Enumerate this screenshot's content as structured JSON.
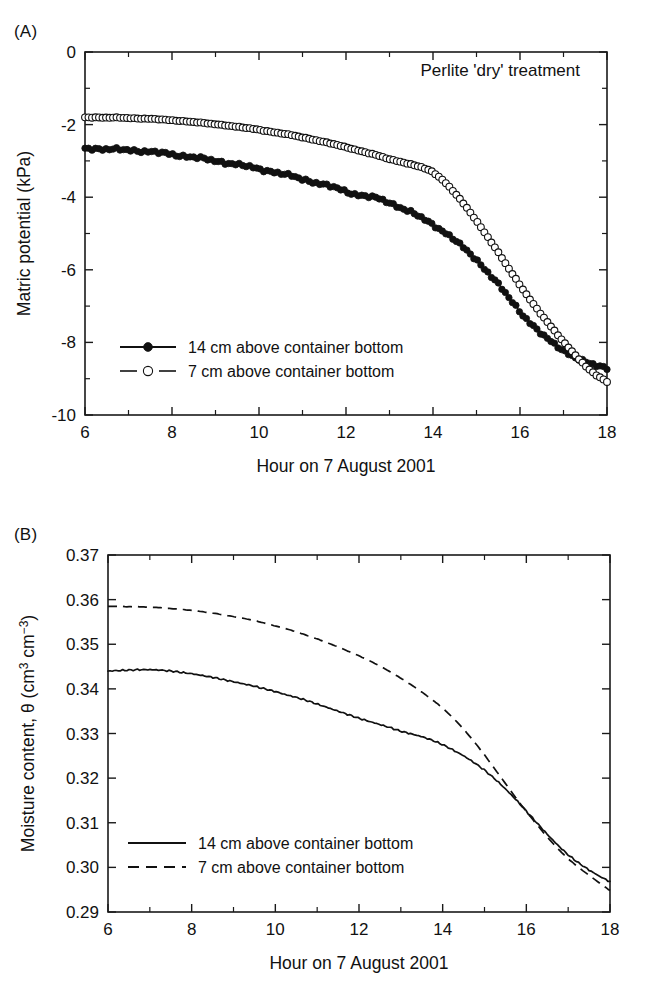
{
  "figure": {
    "panel_a_label": "(A)",
    "panel_b_label": "(B)"
  },
  "panel_a": {
    "annotation": "Perlite 'dry' treatment",
    "xlabel": "Hour on 7 August 2001",
    "ylabel": "Matric potential (kPa)",
    "xticks": [
      "6",
      "8",
      "10",
      "12",
      "14",
      "16",
      "18"
    ],
    "yticks": [
      "0",
      "-2",
      "-4",
      "-6",
      "-8",
      "-10"
    ],
    "legend": [
      {
        "label": "14 cm above container bottom",
        "marker": "filled-circle",
        "line": "solid"
      },
      {
        "label": "7 cm above container bottom",
        "marker": "open-circle",
        "line": "dashed"
      }
    ]
  },
  "panel_b": {
    "xlabel": "Hour on 7 August 2001",
    "ylabel_prefix": "Moisture content, ",
    "ylabel_theta": "θ",
    "ylabel_unit_open": " (cm",
    "ylabel_sup1": "3",
    "ylabel_mid": " cm",
    "ylabel_sup2": "−3",
    "ylabel_close": ")",
    "xticks": [
      "6",
      "8",
      "10",
      "12",
      "14",
      "16",
      "18"
    ],
    "yticks": [
      "0.37",
      "0.36",
      "0.35",
      "0.34",
      "0.33",
      "0.32",
      "0.31",
      "0.30",
      "0.29"
    ],
    "legend": [
      {
        "label": "14 cm above container bottom",
        "line": "solid"
      },
      {
        "label": "7 cm above container bottom",
        "line": "dashed"
      }
    ]
  },
  "chart_data": [
    {
      "type": "scatter",
      "panel": "A",
      "title": "Perlite 'dry' treatment",
      "xlabel": "Hour on 7 August 2001",
      "ylabel": "Matric potential (kPa)",
      "xlim": [
        6,
        18
      ],
      "ylim": [
        -10,
        0
      ],
      "xticks": [
        6,
        8,
        10,
        12,
        14,
        16,
        18
      ],
      "xticks_minor_step": 1,
      "yticks": [
        0,
        -2,
        -4,
        -6,
        -8,
        -10
      ],
      "yticks_minor_step": 1,
      "grid": false,
      "legend_position": "lower-left-inside",
      "x": [
        6.0,
        6.25,
        6.5,
        6.75,
        7.0,
        7.25,
        7.5,
        7.75,
        8.0,
        8.25,
        8.5,
        8.75,
        9.0,
        9.25,
        9.5,
        9.75,
        10.0,
        10.25,
        10.5,
        10.75,
        11.0,
        11.25,
        11.5,
        11.75,
        12.0,
        12.25,
        12.5,
        12.75,
        13.0,
        13.25,
        13.5,
        13.75,
        14.0,
        14.25,
        14.5,
        14.75,
        15.0,
        15.25,
        15.5,
        15.75,
        16.0,
        16.25,
        16.5,
        16.75,
        17.0,
        17.25,
        17.5,
        17.75,
        18.0
      ],
      "series": [
        {
          "name": "14 cm above container bottom",
          "marker": "filled-circle",
          "line": "solid",
          "values": [
            -2.65,
            -2.66,
            -2.68,
            -2.69,
            -2.7,
            -2.72,
            -2.75,
            -2.78,
            -2.82,
            -2.86,
            -2.9,
            -2.95,
            -3.0,
            -3.05,
            -3.1,
            -3.16,
            -3.22,
            -3.28,
            -3.35,
            -3.42,
            -3.5,
            -3.58,
            -3.66,
            -3.74,
            -3.84,
            -3.93,
            -3.98,
            -4.04,
            -4.15,
            -4.28,
            -4.42,
            -4.58,
            -4.75,
            -4.95,
            -5.18,
            -5.45,
            -5.72,
            -6.05,
            -6.4,
            -6.78,
            -7.15,
            -7.48,
            -7.78,
            -8.02,
            -8.22,
            -8.4,
            -8.55,
            -8.64,
            -8.7
          ]
        },
        {
          "name": "7 cm above container bottom",
          "marker": "open-circle",
          "line": "dashed",
          "values": [
            -1.8,
            -1.8,
            -1.81,
            -1.81,
            -1.82,
            -1.83,
            -1.84,
            -1.86,
            -1.88,
            -1.9,
            -1.93,
            -1.96,
            -1.99,
            -2.02,
            -2.06,
            -2.1,
            -2.14,
            -2.19,
            -2.24,
            -2.29,
            -2.35,
            -2.41,
            -2.48,
            -2.55,
            -2.62,
            -2.7,
            -2.78,
            -2.86,
            -2.95,
            -3.02,
            -3.1,
            -3.18,
            -3.3,
            -3.55,
            -3.88,
            -4.25,
            -4.65,
            -5.08,
            -5.52,
            -5.98,
            -6.42,
            -6.85,
            -7.25,
            -7.62,
            -7.98,
            -8.32,
            -8.65,
            -8.9,
            -9.08
          ]
        }
      ]
    },
    {
      "type": "line",
      "panel": "B",
      "title": "",
      "xlabel": "Hour on 7 August 2001",
      "ylabel": "Moisture content, θ (cm3 cm-3)",
      "xlim": [
        6,
        18
      ],
      "ylim": [
        0.29,
        0.37
      ],
      "xticks": [
        6,
        8,
        10,
        12,
        14,
        16,
        18
      ],
      "xticks_minor_step": 1,
      "yticks": [
        0.29,
        0.3,
        0.31,
        0.32,
        0.33,
        0.34,
        0.35,
        0.36,
        0.37
      ],
      "grid": false,
      "legend_position": "lower-left-inside",
      "x": [
        6.0,
        6.25,
        6.5,
        6.75,
        7.0,
        7.25,
        7.5,
        7.75,
        8.0,
        8.25,
        8.5,
        8.75,
        9.0,
        9.25,
        9.5,
        9.75,
        10.0,
        10.25,
        10.5,
        10.75,
        11.0,
        11.25,
        11.5,
        11.75,
        12.0,
        12.25,
        12.5,
        12.75,
        13.0,
        13.25,
        13.5,
        13.75,
        14.0,
        14.25,
        14.5,
        14.75,
        15.0,
        15.25,
        15.5,
        15.75,
        16.0,
        16.25,
        16.5,
        16.75,
        17.0,
        17.25,
        17.5,
        17.75,
        18.0
      ],
      "series": [
        {
          "name": "14 cm above container bottom",
          "line": "solid",
          "values": [
            0.344,
            0.3441,
            0.3442,
            0.3443,
            0.3443,
            0.3442,
            0.344,
            0.3437,
            0.3434,
            0.343,
            0.3426,
            0.3421,
            0.3416,
            0.3411,
            0.3406,
            0.34,
            0.3394,
            0.3387,
            0.3381,
            0.3374,
            0.3366,
            0.3358,
            0.335,
            0.3342,
            0.3334,
            0.3327,
            0.332,
            0.3313,
            0.3305,
            0.3299,
            0.3293,
            0.3285,
            0.3275,
            0.3263,
            0.325,
            0.3235,
            0.3218,
            0.3198,
            0.3176,
            0.3152,
            0.3126,
            0.31,
            0.3074,
            0.305,
            0.3028,
            0.301,
            0.2994,
            0.298,
            0.2968
          ]
        },
        {
          "name": "7 cm above container bottom",
          "line": "dashed",
          "values": [
            0.3585,
            0.3585,
            0.3584,
            0.3584,
            0.3583,
            0.3582,
            0.358,
            0.3578,
            0.3576,
            0.3573,
            0.357,
            0.3566,
            0.3562,
            0.3558,
            0.3553,
            0.3547,
            0.3541,
            0.3535,
            0.3528,
            0.352,
            0.3512,
            0.3503,
            0.3494,
            0.3484,
            0.3474,
            0.3463,
            0.3451,
            0.3438,
            0.3424,
            0.3409,
            0.3393,
            0.3376,
            0.3357,
            0.3335,
            0.331,
            0.3282,
            0.3252,
            0.322,
            0.3188,
            0.3156,
            0.3125,
            0.3096,
            0.3068,
            0.3042,
            0.3019,
            0.3,
            0.2982,
            0.2965,
            0.2948
          ]
        }
      ]
    }
  ]
}
